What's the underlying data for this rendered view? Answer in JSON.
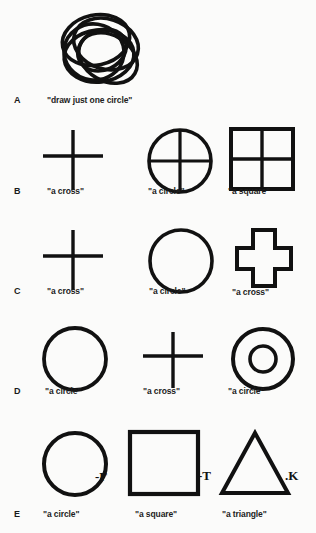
{
  "figure": {
    "background_color": "#fbfbfa",
    "ink_color": "#111111",
    "width": 316,
    "height": 533
  },
  "rows": [
    {
      "letter": "A",
      "items": [
        {
          "shape": "scribbled-overlapping-circles",
          "caption": "\"draw just one circle\"",
          "annotation": ""
        }
      ]
    },
    {
      "letter": "B",
      "items": [
        {
          "shape": "line-cross",
          "caption": "\"a cross\"",
          "annotation": ""
        },
        {
          "shape": "circle-quartered",
          "caption": "\"a circle\"",
          "annotation": ""
        },
        {
          "shape": "square-quartered",
          "caption": "\"a square\"",
          "annotation": ""
        }
      ]
    },
    {
      "letter": "C",
      "items": [
        {
          "shape": "line-cross",
          "caption": "\"a cross\"",
          "annotation": ""
        },
        {
          "shape": "circle-open",
          "caption": "\"a circle\"",
          "annotation": ""
        },
        {
          "shape": "plus-outline",
          "caption": "\"a cross\"",
          "annotation": ""
        }
      ]
    },
    {
      "letter": "D",
      "items": [
        {
          "shape": "circle-open",
          "caption": "\"a circle\"",
          "annotation": ""
        },
        {
          "shape": "line-cross",
          "caption": "\"a cross\"",
          "annotation": ""
        },
        {
          "shape": "concentric-circles",
          "caption": "\"a circle\"",
          "annotation": ""
        }
      ]
    },
    {
      "letter": "E",
      "items": [
        {
          "shape": "circle-open",
          "caption": "\"a circle\"",
          "annotation": "-Γ"
        },
        {
          "shape": "square-open",
          "caption": "\"a square\"",
          "annotation": "-T"
        },
        {
          "shape": "triangle-open",
          "caption": "\"a triangle\"",
          "annotation": ".K"
        }
      ]
    }
  ]
}
